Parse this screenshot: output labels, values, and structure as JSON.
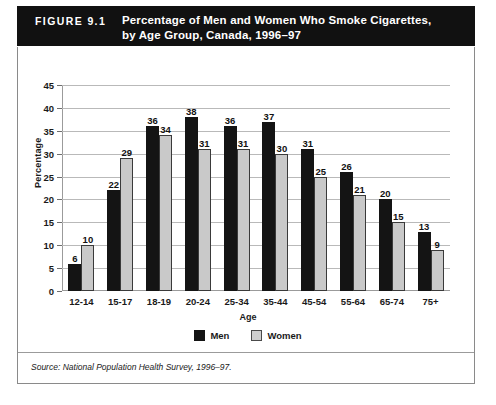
{
  "banner": {
    "figure_number": "FIGURE 9.1",
    "title_line1": "Percentage of Men and Women Who Smoke Cigarettes,",
    "title_line2": "by Age Group, Canada, 1996–97"
  },
  "source": {
    "text": "Source: National Population Health Survey, 1996–97."
  },
  "legend": {
    "men_label": "Men",
    "women_label": "Women"
  },
  "colors": {
    "men_bar": "#141414",
    "women_bar": "#c9c9c9",
    "women_bar_outline": "#3a3a3a",
    "banner_background": "#111111",
    "banner_text": "#ffffff",
    "gridline": "#b9b9b9",
    "frame": "#8a8a8a"
  },
  "chart_data": {
    "type": "bar",
    "title": "Percentage of Men and Women Who Smoke Cigarettes, by Age Group, Canada, 1996–97",
    "xlabel": "Age",
    "ylabel": "Percentage",
    "ylim": [
      0,
      45
    ],
    "yticks": [
      0,
      5,
      10,
      15,
      20,
      25,
      30,
      35,
      40,
      45
    ],
    "grid": true,
    "legend_position": "bottom-center",
    "categories": [
      "12-14",
      "15-17",
      "18-19",
      "20-24",
      "25-34",
      "35-44",
      "45-54",
      "55-64",
      "65-74",
      "75+"
    ],
    "series": [
      {
        "name": "Men",
        "values": [
          6,
          22,
          36,
          38,
          36,
          37,
          31,
          26,
          20,
          13
        ]
      },
      {
        "name": "Women",
        "values": [
          10,
          29,
          34,
          31,
          31,
          30,
          25,
          21,
          15,
          9
        ]
      }
    ]
  }
}
